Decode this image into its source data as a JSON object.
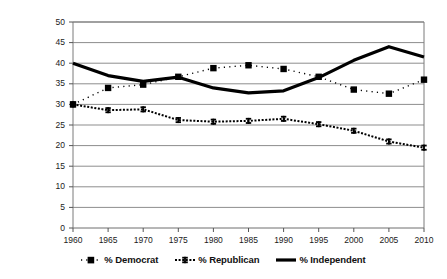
{
  "chart_data": {
    "type": "line",
    "title": "",
    "xlabel": "",
    "ylabel": "",
    "x": [
      1960,
      1965,
      1970,
      1975,
      1980,
      1985,
      1990,
      1995,
      2000,
      2005,
      2010
    ],
    "xtick_labels": [
      "1960",
      "1965",
      "1970",
      "1975",
      "1980",
      "1985",
      "1990",
      "1995",
      "2000",
      "2005",
      "2010"
    ],
    "ytick_labels": [
      "0",
      "5",
      "10",
      "15",
      "20",
      "25",
      "30",
      "35",
      "40",
      "45",
      "50"
    ],
    "yticks": [
      0,
      5,
      10,
      15,
      20,
      25,
      30,
      35,
      40,
      45,
      50
    ],
    "ylim": [
      0,
      50
    ],
    "xlim": [
      1960,
      2010
    ],
    "grid": "horizontal",
    "legend_position": "bottom",
    "series": [
      {
        "name": "% Democrat",
        "style": "fine-dotted",
        "marker": "filled-square",
        "color": "#000000",
        "values": [
          30.0,
          34.0,
          34.8,
          36.7,
          38.8,
          39.5,
          38.6,
          36.7,
          33.6,
          32.6,
          36.0
        ]
      },
      {
        "name": "% Republican",
        "style": "dotted",
        "marker": "i-beam",
        "color": "#000000",
        "values": [
          30.0,
          28.6,
          28.8,
          26.2,
          25.8,
          26.0,
          26.5,
          25.2,
          23.6,
          21.0,
          19.5
        ]
      },
      {
        "name": "% Independent",
        "style": "thick-solid",
        "marker": "none",
        "color": "#000000",
        "values": [
          40.0,
          37.0,
          35.6,
          36.6,
          34.0,
          32.8,
          33.3,
          36.5,
          40.7,
          44.0,
          41.5
        ]
      }
    ]
  },
  "legend": {
    "items": [
      {
        "label": "% Democrat",
        "swatch": "square-marker-swatch"
      },
      {
        "label": "% Republican",
        "swatch": "ibeam-marker-swatch"
      },
      {
        "label": "% Independent",
        "swatch": "thick-line-swatch"
      }
    ]
  },
  "axes": {
    "y_axis_name": "percent-axis",
    "x_axis_name": "year-axis"
  }
}
